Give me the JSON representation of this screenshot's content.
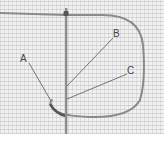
{
  "figure": {
    "labels": [
      {
        "id": "A",
        "text": "A"
      },
      {
        "id": "B",
        "text": "B"
      },
      {
        "id": "C",
        "text": "C"
      }
    ],
    "colors": {
      "canvas": "#f1f1f1",
      "thread": "#8a8a8a",
      "needle": "#6e6e6e",
      "leader": "#555555"
    }
  }
}
